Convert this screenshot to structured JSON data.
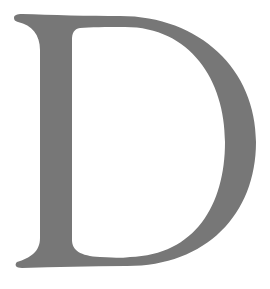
{
  "glyph": {
    "character": "D",
    "color": "#777777",
    "background": "#ffffff"
  }
}
